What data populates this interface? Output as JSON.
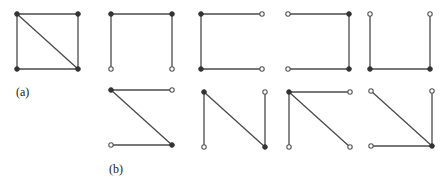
{
  "figure": {
    "colors": {
      "edge": "#4a4a4a",
      "vertex_filled": "#333333",
      "vertex_open_stroke": "#555555",
      "background": "#ffffff"
    },
    "labels": [
      {
        "id": "a",
        "text": "(a)",
        "x": 16,
        "y": 96
      },
      {
        "id": "b",
        "text": "(b)",
        "x": 109,
        "y": 173
      }
    ],
    "graphs": [
      {
        "id": "graph-a",
        "group": "a",
        "vertices": {
          "TL": [
            17,
            14
          ],
          "TR": [
            78,
            14
          ],
          "BL": [
            17,
            69
          ],
          "BR": [
            78,
            69
          ]
        },
        "edges": [
          [
            "TL",
            "TR"
          ],
          [
            "TL",
            "BL"
          ],
          [
            "TR",
            "BR"
          ],
          [
            "BL",
            "BR"
          ],
          [
            "TL",
            "BR"
          ]
        ]
      },
      {
        "id": "tree-b1",
        "group": "b",
        "vertices": {
          "TL": [
            111,
            14
          ],
          "TR": [
            172,
            14
          ],
          "BL": [
            111,
            69
          ],
          "BR": [
            172,
            69
          ]
        },
        "edges": [
          [
            "TL",
            "TR"
          ],
          [
            "TL",
            "BL"
          ],
          [
            "TR",
            "BR"
          ]
        ]
      },
      {
        "id": "tree-b2",
        "group": "b",
        "vertices": {
          "TL": [
            201,
            14
          ],
          "TR": [
            262,
            14
          ],
          "BL": [
            201,
            69
          ],
          "BR": [
            262,
            69
          ]
        },
        "edges": [
          [
            "TL",
            "TR"
          ],
          [
            "TL",
            "BL"
          ],
          [
            "BL",
            "BR"
          ]
        ]
      },
      {
        "id": "tree-b3",
        "group": "b",
        "vertices": {
          "TL": [
            288,
            14
          ],
          "TR": [
            349,
            14
          ],
          "BL": [
            288,
            69
          ],
          "BR": [
            349,
            69
          ]
        },
        "edges": [
          [
            "TL",
            "TR"
          ],
          [
            "TR",
            "BR"
          ],
          [
            "BL",
            "BR"
          ]
        ]
      },
      {
        "id": "tree-b4",
        "group": "b",
        "vertices": {
          "TL": [
            370,
            14
          ],
          "TR": [
            430,
            14
          ],
          "BL": [
            370,
            69
          ],
          "BR": [
            430,
            69
          ]
        },
        "edges": [
          [
            "TL",
            "BL"
          ],
          [
            "TR",
            "BR"
          ],
          [
            "BL",
            "BR"
          ]
        ]
      },
      {
        "id": "tree-b5",
        "group": "b",
        "vertices": {
          "TL": [
            111,
            90
          ],
          "TR": [
            172,
            90
          ],
          "BL": [
            111,
            145
          ],
          "BR": [
            172,
            145
          ]
        },
        "edges": [
          [
            "TL",
            "TR"
          ],
          [
            "TL",
            "BR"
          ],
          [
            "BL",
            "BR"
          ]
        ]
      },
      {
        "id": "tree-b6",
        "group": "b",
        "vertices": {
          "TL": [
            204,
            92
          ],
          "TR": [
            265,
            92
          ],
          "BL": [
            204,
            147
          ],
          "BR": [
            265,
            147
          ]
        },
        "edges": [
          [
            "TL",
            "BL"
          ],
          [
            "TL",
            "BR"
          ],
          [
            "TR",
            "BR"
          ]
        ]
      },
      {
        "id": "tree-b7",
        "group": "b",
        "vertices": {
          "TL": [
            289,
            92
          ],
          "TR": [
            350,
            92
          ],
          "BL": [
            289,
            147
          ],
          "BR": [
            350,
            147
          ]
        },
        "edges": [
          [
            "TL",
            "TR"
          ],
          [
            "TL",
            "BL"
          ],
          [
            "TL",
            "BR"
          ]
        ]
      },
      {
        "id": "tree-b8",
        "group": "b",
        "vertices": {
          "TL": [
            371,
            91
          ],
          "TR": [
            432,
            91
          ],
          "BL": [
            371,
            146
          ],
          "BR": [
            432,
            146
          ]
        },
        "edges": [
          [
            "TL",
            "BR"
          ],
          [
            "TR",
            "BR"
          ],
          [
            "BL",
            "BR"
          ]
        ]
      }
    ]
  }
}
